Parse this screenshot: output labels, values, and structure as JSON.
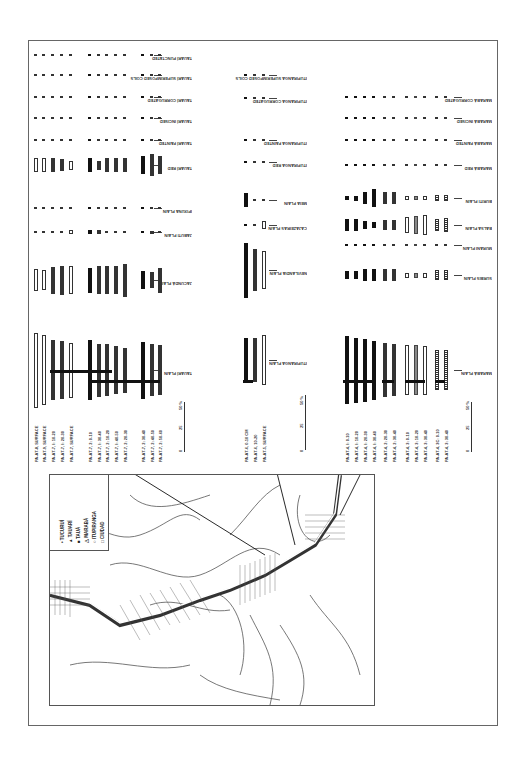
{
  "figure": {
    "orientation": "rotated-90",
    "scale_bar": {
      "ticks": [
        "0",
        "25",
        "50 %"
      ]
    }
  },
  "chart_data": {
    "type": "bar",
    "title": "",
    "unit": "%",
    "ylim": [
      0,
      50
    ],
    "groups": [
      {
        "name": "Tauarí / left group",
        "categories": [
          "TAUARÍ PLAIN",
          "JACUNDÁ PLAIN",
          "JABUTI PLAIN",
          "IPIXUNA PLAIN",
          "TAUARÍ RED",
          "TAUARÍ PAINTED",
          "TAUARÍ INCISED",
          "TAUARÍ CORRUGATED",
          "TAUARÍ SUPERIMPOSED COILS",
          "TAUARÍ PUNCTATED"
        ],
        "samples": [
          "PA-AT-8, SURFACE",
          "PA-AT-9, SURFACE",
          "PA-AT-7, I: 10-20",
          "PA-AT-7, I: 20-30",
          "PA-AT-7, SURFACE",
          "PA-AT-7, 2: 0-10",
          "PA-AT-7, I: 30-40",
          "PA-AT-7, 2: 10-20",
          "PA-AT-7, I: 40-50",
          "PA-AT-7, 2: 20-30",
          "PA-AT-7, 2: 30-40",
          "PA-AT-7, 2: 40-50",
          "PA-AT-7, 2: 50-60"
        ]
      },
      {
        "name": "Itupiranga / middle group",
        "categories": [
          "ITUPIRANGA PLAIN",
          "NEVILANDIA PLAIN",
          "CAJAZEIRAS PLAIN",
          "MEIA PLAIN",
          "ITUPIRANGA RED",
          "ITUPIRANGA PAINTED",
          "ITUPIRANGA CORRUGATED",
          "ITUPIRANGA SUPERIMPOSED COILS"
        ],
        "samples": [
          "PA-AT-6, 0-10 CM",
          "PA-AT-6, 10-20",
          "PA-AT-5, SURFACE"
        ]
      },
      {
        "name": "Marabá / right group",
        "categories": [
          "MARABÁ PLAIN",
          "SURBIS PLAIN",
          "MURANI PLAIN",
          "BALSA PLAIN",
          "BURITI PLAIN",
          "MARABÁ RED",
          "MARABÁ PAINTED",
          "MARABÁ INCISED",
          "MARABÁ CORRUGATED"
        ],
        "samples": [
          "PA-AT-4, I: 0-10",
          "PA-AT-4, I: 10-20",
          "PA-AT-4, I: 20-30",
          "PA-AT-4, I: 30-40",
          "PA-AT-4, 2: 20-30",
          "PA-AT-4, 2: 30-40",
          "PA-AT-4, 3: 0-10",
          "PA-AT-4, 3: 10-20",
          "PA-AT-4, 3: 30-40",
          "PA-AT-4, 3C: 0-10",
          "PA-AT-4, 3: 30-40"
        ]
      }
    ]
  },
  "map": {
    "legend": [
      {
        "symbol": "•",
        "label": "TUCURUÍ"
      },
      {
        "symbol": "▲",
        "label": "TAUARÍ"
      },
      {
        "symbol": "■",
        "label": "TAUÁ"
      },
      {
        "symbol": "△",
        "label": "MARABÁ"
      },
      {
        "symbol": "○",
        "label": "ITUPIRANGA"
      },
      {
        "symbol": "□",
        "label": "CIUDAD"
      }
    ],
    "places": [
      "MARABÁ",
      "JATOBAL",
      "ITUPIRANGA",
      "TUCURUÍ"
    ],
    "site_labels": [
      "AT-4",
      "AT-5",
      "AT-6",
      "AT-7",
      "AT-8",
      "AT-9",
      "BA-11",
      "BA-12"
    ],
    "coords": [
      "49°",
      "5°",
      "4°",
      "50°"
    ]
  }
}
